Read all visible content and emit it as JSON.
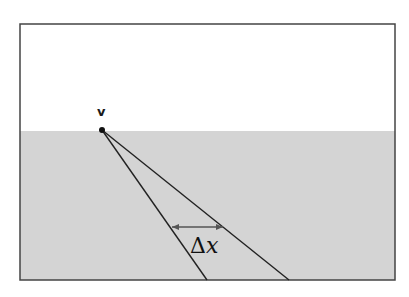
{
  "diagram": {
    "vertex_label": "v",
    "delta_label": "Δ",
    "delta_var": "x",
    "colors": {
      "background": "#ffffff",
      "ground": "#d4d4d4",
      "frame": "#444444",
      "lines": "#222222",
      "arrow": "#555555"
    }
  }
}
